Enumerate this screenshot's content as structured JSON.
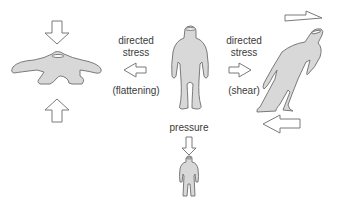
{
  "diagram": {
    "type": "deformation-illustration",
    "colors": {
      "figure_fill": "#d8d8d8",
      "stroke": "#7a7a7a",
      "arrow_fill": "#ffffff"
    },
    "figures": [
      {
        "id": "flattened",
        "position": "left",
        "description": "figure flattened by vertical compression"
      },
      {
        "id": "original",
        "position": "center",
        "description": "undeformed figure"
      },
      {
        "id": "sheared",
        "position": "right",
        "description": "figure tilted by shear"
      },
      {
        "id": "shrunk",
        "position": "bottom",
        "description": "smaller figure from uniform pressure"
      }
    ],
    "labels": {
      "left": {
        "line1": "directed",
        "line2": "stress",
        "note": "(flattening)"
      },
      "right": {
        "line1": "directed",
        "line2": "stress",
        "note": "(shear)"
      },
      "bottom": {
        "text": "pressure"
      }
    }
  }
}
